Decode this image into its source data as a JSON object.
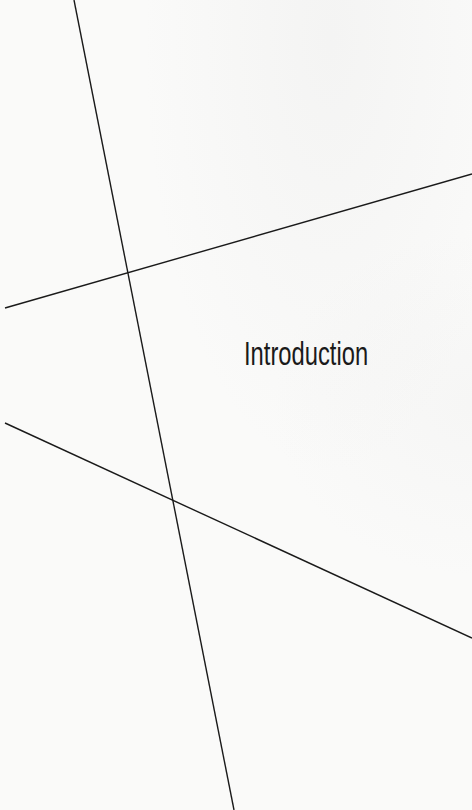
{
  "page": {
    "title": "Introduction",
    "background_color": "#fafaf9",
    "text_color": "#1a1a1a",
    "line_color": "#1a1a1a"
  },
  "decorative_lines": [
    {
      "name": "steep-line",
      "x1": 74,
      "y1": 0,
      "x2": 234,
      "y2": 810
    },
    {
      "name": "upper-slant-line",
      "x1": 5,
      "y1": 308,
      "x2": 472,
      "y2": 174
    },
    {
      "name": "lower-slant-line",
      "x1": 5,
      "y1": 423,
      "x2": 472,
      "y2": 638
    }
  ]
}
